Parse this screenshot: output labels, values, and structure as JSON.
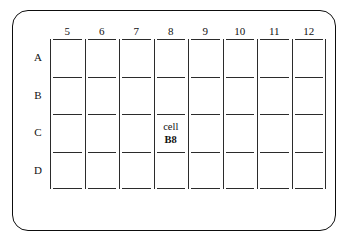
{
  "diagram": {
    "background_color": "#ffffff",
    "line_color": "#2b2b2b",
    "frame_color": "#0d0d0d",
    "text_color": "#111111"
  },
  "grid": {
    "column_headers": [
      "5",
      "6",
      "7",
      "8",
      "9",
      "10",
      "11",
      "12"
    ],
    "row_labels": [
      "A",
      "B",
      "C",
      "D"
    ],
    "column_count": 8,
    "row_count": 4
  },
  "annotation": {
    "line1": "cell",
    "line2": "B8",
    "column": "8",
    "row": "B"
  }
}
